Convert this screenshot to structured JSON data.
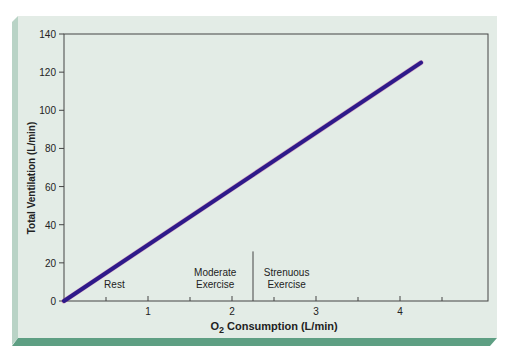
{
  "chart_data": {
    "type": "line",
    "title": "",
    "xlabel_prefix": "O",
    "xlabel_sub": "2",
    "xlabel_rest": " Consumption (L/min)",
    "xlabel": "O2 Consumption (L/min)",
    "ylabel": "Total Ventilation (L/min)",
    "xlim": [
      0,
      5.4
    ],
    "ylim": [
      0,
      140
    ],
    "x_ticks": [
      1,
      2,
      3,
      4
    ],
    "x_minor_ticks": [
      0.5,
      1.5,
      2.5,
      3.5,
      4.5
    ],
    "y_ticks": [
      0,
      20,
      40,
      60,
      80,
      100,
      120,
      140
    ],
    "grid": false,
    "legend": null,
    "series": [
      {
        "name": "Ventilation",
        "color": "#2e1a8a",
        "x": [
          0,
          4.25
        ],
        "y": [
          0,
          125
        ]
      }
    ],
    "regions": [
      {
        "label_lines": [
          "Rest"
        ],
        "x_center": 0.6
      },
      {
        "label_lines": [
          "Moderate",
          "Exercise"
        ],
        "x_center": 1.8
      },
      {
        "label_lines": [
          "Strenuous",
          "Exercise"
        ],
        "x_center": 2.65
      }
    ],
    "divider_x": 2.25,
    "divider_top_value": 26
  },
  "colors": {
    "panel": "#e3ece6",
    "bevel_left": "#b9d3c6",
    "bevel_bottom": "#5e9f83",
    "axis": "#444444",
    "text": "#222222",
    "line": "#2e1a8a",
    "line_edge": "#c02080"
  }
}
